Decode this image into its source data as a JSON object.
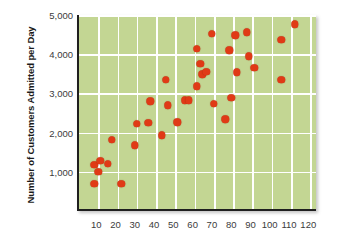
{
  "chart_data": {
    "type": "scatter",
    "title": "",
    "xlabel": "",
    "ylabel": "Number of Customers Admitted per Day",
    "xlim": [
      0,
      124
    ],
    "ylim": [
      0,
      5000
    ],
    "xticks": [
      10,
      20,
      30,
      40,
      50,
      60,
      70,
      80,
      90,
      100,
      110,
      120
    ],
    "xtick_labels": [
      "10",
      "20",
      "30",
      "40",
      "50",
      "60",
      "70",
      "80",
      "90",
      "100",
      "110",
      "120"
    ],
    "yticks": [
      1000,
      2000,
      3000,
      4000,
      5000
    ],
    "ytick_labels": [
      "1,000",
      "2,000",
      "3,000",
      "4,000",
      "5,000"
    ],
    "grid": true,
    "legend": "none",
    "marker_color": "#e03a16",
    "plot_background": "#c3d693",
    "gridline_color": "#ffffff",
    "points": [
      {
        "x": 8,
        "y": 1180
      },
      {
        "x": 8,
        "y": 700
      },
      {
        "x": 10,
        "y": 1000
      },
      {
        "x": 11,
        "y": 1280
      },
      {
        "x": 15,
        "y": 1210
      },
      {
        "x": 17,
        "y": 1810
      },
      {
        "x": 22,
        "y": 690
      },
      {
        "x": 29,
        "y": 1680
      },
      {
        "x": 30,
        "y": 2230
      },
      {
        "x": 36,
        "y": 2250
      },
      {
        "x": 37,
        "y": 2800
      },
      {
        "x": 43,
        "y": 1930
      },
      {
        "x": 45,
        "y": 3340
      },
      {
        "x": 46,
        "y": 2700
      },
      {
        "x": 51,
        "y": 2260
      },
      {
        "x": 55,
        "y": 2820
      },
      {
        "x": 57,
        "y": 2820
      },
      {
        "x": 61,
        "y": 4140
      },
      {
        "x": 61,
        "y": 3180
      },
      {
        "x": 63,
        "y": 3760
      },
      {
        "x": 64,
        "y": 3490
      },
      {
        "x": 66,
        "y": 3550
      },
      {
        "x": 69,
        "y": 4520
      },
      {
        "x": 70,
        "y": 2740
      },
      {
        "x": 76,
        "y": 2340
      },
      {
        "x": 78,
        "y": 4100
      },
      {
        "x": 79,
        "y": 2890
      },
      {
        "x": 81,
        "y": 4480
      },
      {
        "x": 82,
        "y": 3540
      },
      {
        "x": 87,
        "y": 4560
      },
      {
        "x": 88,
        "y": 3950
      },
      {
        "x": 91,
        "y": 3650
      },
      {
        "x": 105,
        "y": 4360
      },
      {
        "x": 105,
        "y": 3350
      },
      {
        "x": 112,
        "y": 4760
      }
    ]
  }
}
